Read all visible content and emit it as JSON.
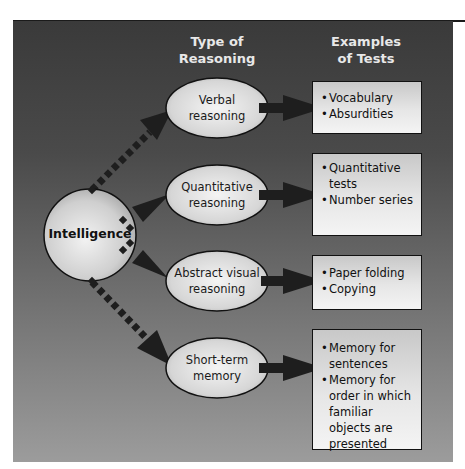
{
  "headers": {
    "type_of_reasoning": [
      "Type of",
      "Reasoning"
    ],
    "examples_of_tests": [
      "Examples",
      "of Tests"
    ]
  },
  "core": {
    "label": "Intelligence"
  },
  "branches": [
    {
      "reasoning": [
        "Verbal",
        "reasoning"
      ],
      "tests": [
        "Vocabulary",
        "Absurdities"
      ]
    },
    {
      "reasoning": [
        "Quantitative",
        "reasoning"
      ],
      "tests": [
        "Quantitative tests",
        "Number series"
      ]
    },
    {
      "reasoning": [
        "Abstract visual",
        "reasoning"
      ],
      "tests": [
        "Paper folding",
        "Copying"
      ]
    },
    {
      "reasoning": [
        "Short-term",
        "memory"
      ],
      "tests": [
        "Memory for sentences",
        "Memory for order in which familiar objects are presented"
      ]
    }
  ],
  "colors": {
    "panel_top": "#3a3a3a",
    "panel_bottom": "#9c9c9c",
    "arrow": "#1e1e1e",
    "header_text": "#e8e8e8"
  }
}
